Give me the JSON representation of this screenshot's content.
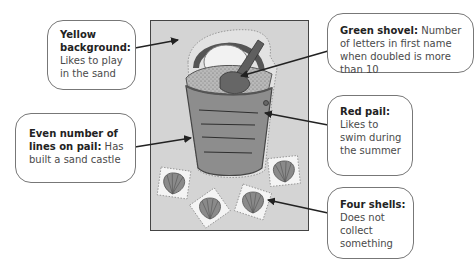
{
  "diagram": {
    "type": "annotated-illustration",
    "colors": {
      "background": "#ffffff",
      "frame_fill": "#d4d4d4",
      "callout_border": "#777777",
      "arrow": "#222222"
    }
  },
  "callouts": [
    {
      "id": "yellow-background",
      "title": "Yellow background:",
      "text": "Likes to play in the sand"
    },
    {
      "id": "even-lines",
      "title": "Even number of lines on pail:",
      "text": "Has built a sand castle"
    },
    {
      "id": "green-shovel",
      "title": "Green shovel:",
      "text": "Number of letters in first name when doubled is more than 10"
    },
    {
      "id": "red-pail",
      "title": "Red pail:",
      "text": "Likes to swim during the summer"
    },
    {
      "id": "four-shells",
      "title": "Four shells:",
      "text": "Does not collect something"
    }
  ],
  "illustration": {
    "pail_lines": 4,
    "shells": 4
  }
}
